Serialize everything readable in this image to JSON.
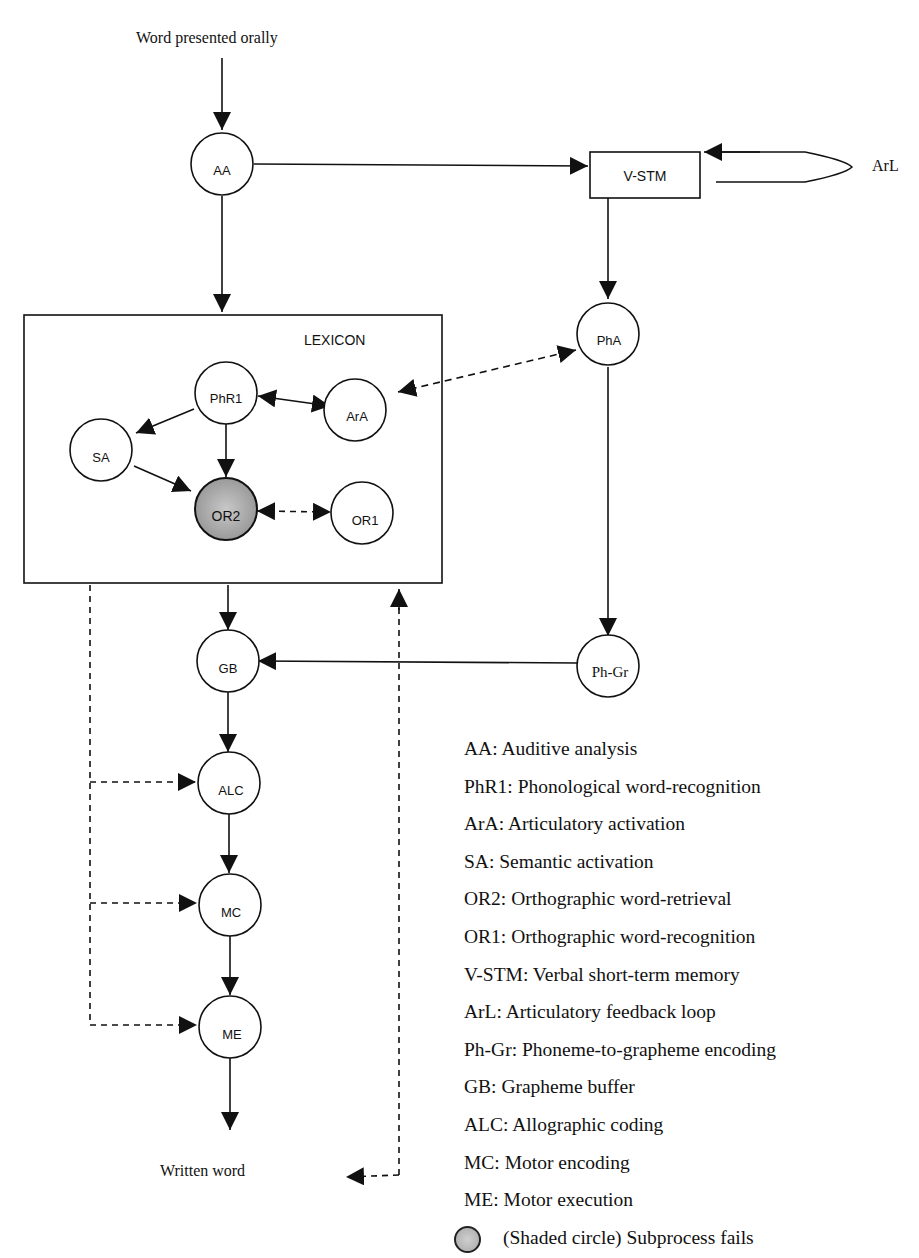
{
  "diagram": {
    "input_label": "Word presented orally",
    "output_label": "Written word",
    "lexicon_label": "LEXICON",
    "loop_label": "ArL",
    "nodes": {
      "AA": "AA",
      "VSTM": "V-STM",
      "PhA": "PhA",
      "PhR1": "PhR1",
      "ArA": "ArA",
      "SA": "SA",
      "OR2": "OR2",
      "OR1": "OR1",
      "GB": "GB",
      "PhGr": "Ph-Gr",
      "ALC": "ALC",
      "MC": "MC",
      "ME": "ME"
    },
    "failed_node": "OR2",
    "colors": {
      "stroke": "#111111",
      "shaded_fill": "#b5b5b5",
      "background": "#ffffff"
    }
  },
  "legend": {
    "items": [
      "AA: Auditive analysis",
      "PhR1: Phonological word-recognition",
      "ArA: Articulatory activation",
      "SA: Semantic activation",
      "OR2: Orthographic word-retrieval",
      "OR1: Orthographic word-recognition",
      "V-STM: Verbal short-term memory",
      "ArL: Articulatory feedback loop",
      "Ph-Gr: Phoneme-to-grapheme encoding",
      "GB: Grapheme buffer",
      "ALC: Allographic coding",
      "MC: Motor encoding",
      "ME: Motor execution"
    ],
    "shaded_note": "(Shaded circle) Subprocess fails"
  }
}
